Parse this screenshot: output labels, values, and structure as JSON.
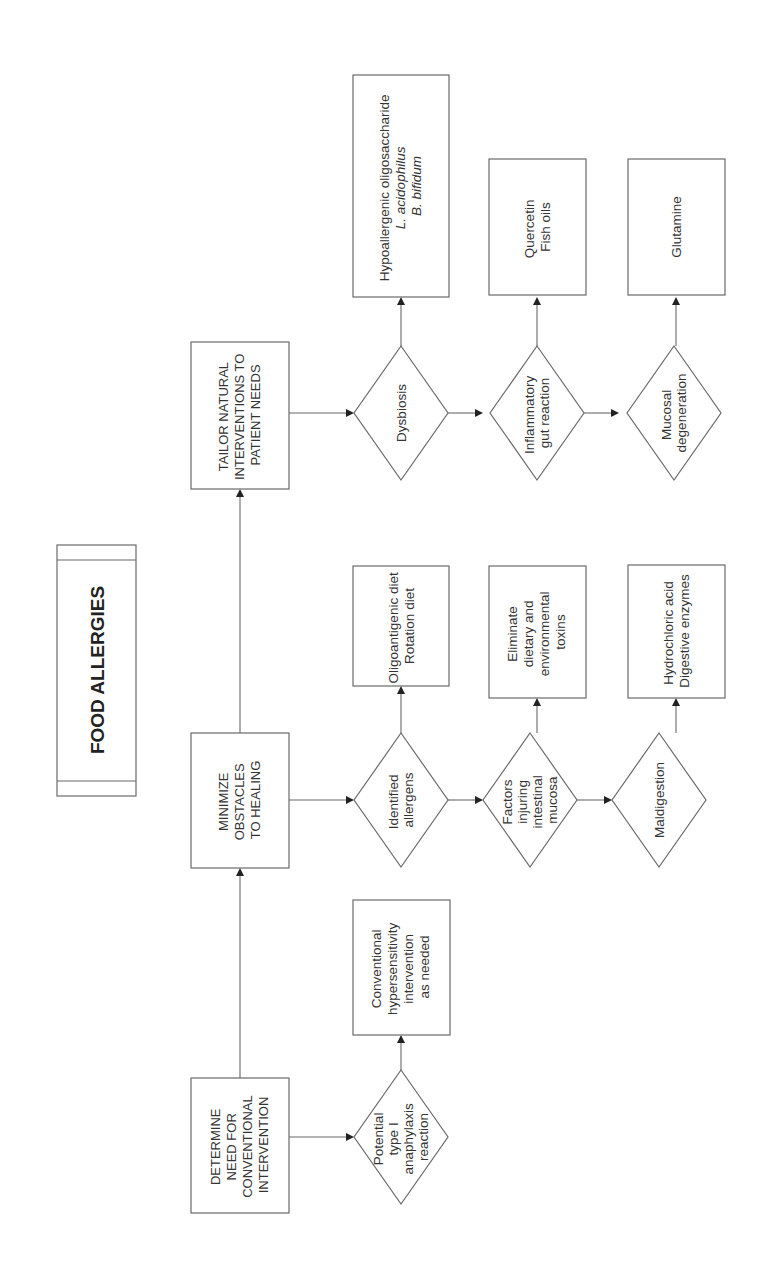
{
  "diagram": {
    "title": "FOOD ALLERGIES",
    "orientation": "rotated -90deg (reads bottom-to-top)",
    "main_steps": [
      {
        "id": "step1",
        "lines": [
          "DETERMINE",
          "NEED FOR",
          "CONVENTIONAL",
          "INTERVENTION"
        ]
      },
      {
        "id": "step2",
        "lines": [
          "MINIMIZE",
          "OBSTACLES",
          "TO HEALING"
        ]
      },
      {
        "id": "step3",
        "lines": [
          "TAILOR NATURAL",
          "INTERVENTIONS TO",
          "PATIENT NEEDS"
        ]
      }
    ],
    "conditions": [
      {
        "id": "c1",
        "step": "step1",
        "lines": [
          "Potential",
          "type I",
          "anaphylaxis",
          "reaction"
        ]
      },
      {
        "id": "c2",
        "step": "step2",
        "lines": [
          "Identified",
          "allergens"
        ]
      },
      {
        "id": "c3",
        "step": "step2",
        "lines": [
          "Factors",
          "injuring",
          "intestinal",
          "mucosa"
        ]
      },
      {
        "id": "c4",
        "step": "step2",
        "lines": [
          "Maldigestion"
        ]
      },
      {
        "id": "c5",
        "step": "step3",
        "lines": [
          "Dysbiosis"
        ]
      },
      {
        "id": "c6",
        "step": "step3",
        "lines": [
          "Inflammatory",
          "gut reaction"
        ]
      },
      {
        "id": "c7",
        "step": "step3",
        "lines": [
          "Mucosal",
          "degeneration"
        ]
      }
    ],
    "interventions": [
      {
        "id": "i1",
        "condition": "c1",
        "lines": [
          "Conventional",
          "hypersensitivity",
          "intervention",
          "as needed"
        ]
      },
      {
        "id": "i2",
        "condition": "c2",
        "lines": [
          "Oligoantigenic diet",
          "Rotation diet"
        ]
      },
      {
        "id": "i3",
        "condition": "c3",
        "lines": [
          "Eliminate",
          "dietary and",
          "environmental",
          "toxins"
        ]
      },
      {
        "id": "i4",
        "condition": "c4",
        "lines": [
          "Hydrochloric acid",
          "Digestive enzymes"
        ]
      },
      {
        "id": "i5",
        "condition": "c5",
        "lines": [
          "Hypoallergenic oligosaccharide",
          "L. acidophilus",
          "B. bifidum"
        ]
      },
      {
        "id": "i6",
        "condition": "c6",
        "lines": [
          "Quercetin",
          "Fish oils"
        ]
      },
      {
        "id": "i7",
        "condition": "c7",
        "lines": [
          "Glutamine"
        ]
      }
    ],
    "colors": {
      "stroke": "#6a6a6a",
      "text": "#333333",
      "arrowhead": "#222222",
      "background": "#ffffff"
    }
  }
}
